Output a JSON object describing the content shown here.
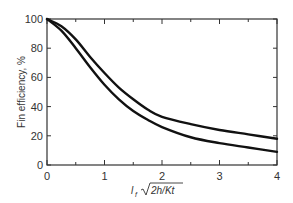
{
  "chart_data": {
    "type": "line",
    "title": "",
    "xlabel": "l_f √(2h/Kt)",
    "xlabel_parts": {
      "var": "l",
      "sub": "f",
      "radicand": "2h/Kt"
    },
    "ylabel": "Fin efficiency, %",
    "xlim": [
      0,
      4
    ],
    "ylim": [
      0,
      100
    ],
    "xticks": [
      0,
      1,
      2,
      3,
      4
    ],
    "xminor_ticks": [
      0.5,
      1.5,
      2.5,
      3.5
    ],
    "yticks": [
      0,
      20,
      40,
      60,
      80,
      100
    ],
    "grid": false,
    "legend": null,
    "x": [
      0,
      0.25,
      0.5,
      0.75,
      1.0,
      1.25,
      1.5,
      1.75,
      2.0,
      2.5,
      3.0,
      3.5,
      4.0
    ],
    "series": [
      {
        "name": "upper curve",
        "values": [
          100,
          95,
          86,
          74,
          63,
          53,
          45,
          38,
          33,
          28,
          24,
          21,
          18
        ]
      },
      {
        "name": "lower curve",
        "values": [
          100,
          92,
          80,
          67,
          55,
          45,
          37,
          31,
          26,
          19,
          15,
          12,
          9
        ]
      }
    ],
    "colors": {
      "line": "#111111",
      "axis": "#333333"
    }
  }
}
